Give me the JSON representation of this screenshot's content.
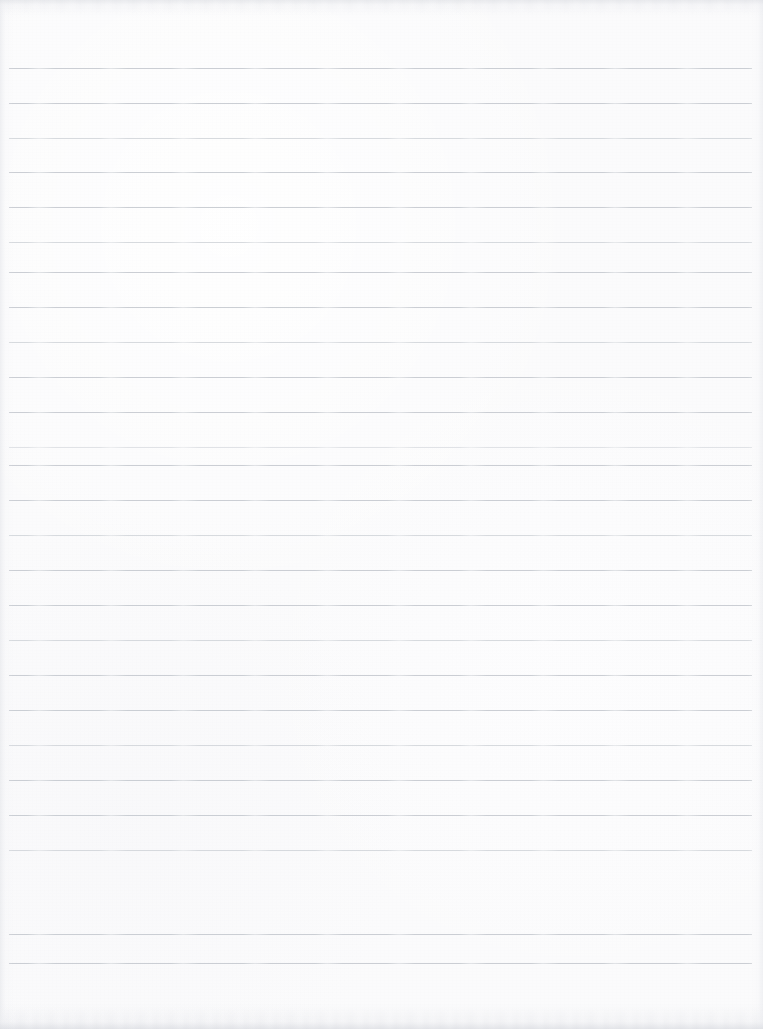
{
  "document": {
    "kind": "scanned-lined-paper",
    "title": "Blank Ruled Notebook Sheet",
    "page_width": 763,
    "page_height": 1029,
    "paper_color": "#fbfbfc",
    "edge_shadow_color": "#dbdde2",
    "has_visible_text": false,
    "has_header": false,
    "has_margin_rule": false,
    "notes": "Empty scanned sheet of ruled paper; no handwriting, headings, page numbers or marks are present."
  },
  "ruling": {
    "line_color": "#c6cad0",
    "line_thickness_px": 1,
    "line_left_px": 9,
    "line_right_px": 752,
    "line_count": 26,
    "first_line_y": 68,
    "last_line_y": 963,
    "nominal_spacing_px": 34.7,
    "lines": [
      {
        "index": 1,
        "y": 68,
        "weight": "normal"
      },
      {
        "index": 2,
        "y": 103,
        "weight": "normal"
      },
      {
        "index": 3,
        "y": 138,
        "weight": "soft"
      },
      {
        "index": 4,
        "y": 172,
        "weight": "normal"
      },
      {
        "index": 5,
        "y": 207,
        "weight": "normal"
      },
      {
        "index": 6,
        "y": 242,
        "weight": "soft"
      },
      {
        "index": 7,
        "y": 272,
        "weight": "normal"
      },
      {
        "index": 8,
        "y": 307,
        "weight": "normal"
      },
      {
        "index": 9,
        "y": 342,
        "weight": "soft"
      },
      {
        "index": 10,
        "y": 377,
        "weight": "normal"
      },
      {
        "index": 11,
        "y": 412,
        "weight": "normal"
      },
      {
        "index": 12,
        "y": 447,
        "weight": "faint"
      },
      {
        "index": 13,
        "y": 465,
        "weight": "normal"
      },
      {
        "index": 14,
        "y": 500,
        "weight": "normal"
      },
      {
        "index": 15,
        "y": 535,
        "weight": "soft"
      },
      {
        "index": 16,
        "y": 570,
        "weight": "normal"
      },
      {
        "index": 17,
        "y": 605,
        "weight": "normal"
      },
      {
        "index": 18,
        "y": 640,
        "weight": "soft"
      },
      {
        "index": 19,
        "y": 675,
        "weight": "normal"
      },
      {
        "index": 20,
        "y": 710,
        "weight": "normal"
      },
      {
        "index": 21,
        "y": 745,
        "weight": "soft"
      },
      {
        "index": 22,
        "y": 780,
        "weight": "normal"
      },
      {
        "index": 23,
        "y": 815,
        "weight": "normal"
      },
      {
        "index": 24,
        "y": 850,
        "weight": "soft"
      },
      {
        "index": 25,
        "y": 934,
        "weight": "normal"
      },
      {
        "index": 26,
        "y": 963,
        "weight": "normal"
      }
    ]
  }
}
